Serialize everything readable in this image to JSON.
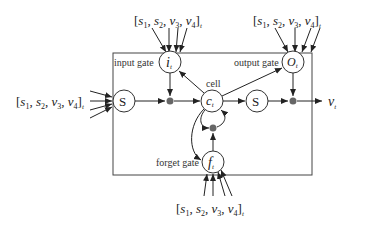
{
  "diagram": {
    "type": "LSTM cell",
    "labels": {
      "input_gate": "input gate",
      "output_gate": "output gate",
      "forget_gate": "forget gate",
      "cell": "cell"
    },
    "nodes": {
      "input_gate_symbol": "i",
      "output_gate_symbol": "O",
      "forget_gate_symbol": "f",
      "cell_symbol": "c",
      "subscript": "t",
      "squash_in": "S",
      "squash_out": "S"
    },
    "inputs": {
      "vector": "[s1, s2, v3, v4]t",
      "open": "[",
      "s": "s",
      "v": "v",
      "sub1": "1",
      "sub2": "2",
      "sub3": "3",
      "sub4": "4",
      "comma": ", ",
      "close": "]",
      "t": "t"
    },
    "output": {
      "symbol": "v",
      "subscript": "t"
    },
    "colors": {
      "line": "#333333",
      "dot": "#666666",
      "background": "#ffffff"
    }
  }
}
